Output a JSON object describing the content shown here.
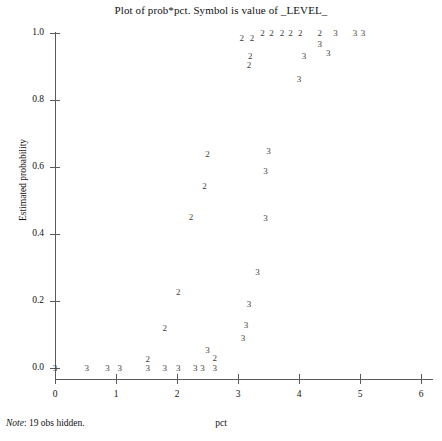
{
  "chart_data": {
    "type": "scatter",
    "title": "Plot of prob*pct. Symbol is value of _LEVEL_",
    "xlabel": "pct",
    "ylabel": "Estimated probability",
    "xlim": [
      -0.2,
      6.2
    ],
    "ylim": [
      -0.02,
      1.04
    ],
    "xticks": [
      "0",
      "1",
      "2",
      "3",
      "4",
      "5",
      "6"
    ],
    "xtick_values": [
      0,
      1,
      2,
      3,
      4,
      5,
      6
    ],
    "yticks": [
      "0.0",
      "0.2",
      "0.4",
      "0.6",
      "0.8",
      "1.0"
    ],
    "ytick_values": [
      0.0,
      0.2,
      0.4,
      0.6,
      0.8,
      1.0
    ],
    "grid": false,
    "legend": "none",
    "symbol_meaning": "plotted character is the value of _LEVEL_",
    "footnote": "19 obs hidden.",
    "footnote_prefix": "Note",
    "points": [
      {
        "x": 3.23,
        "y": 0.985,
        "label": "2"
      },
      {
        "x": 3.4,
        "y": 1.0,
        "label": "2"
      },
      {
        "x": 3.55,
        "y": 1.0,
        "label": "2"
      },
      {
        "x": 3.72,
        "y": 1.0,
        "label": "2"
      },
      {
        "x": 3.86,
        "y": 1.0,
        "label": "2"
      },
      {
        "x": 4.02,
        "y": 1.0,
        "label": "2"
      },
      {
        "x": 4.34,
        "y": 1.0,
        "label": "2"
      },
      {
        "x": 4.34,
        "y": 0.968,
        "label": "3"
      },
      {
        "x": 4.6,
        "y": 1.0,
        "label": "3"
      },
      {
        "x": 4.92,
        "y": 1.0,
        "label": "3"
      },
      {
        "x": 5.05,
        "y": 1.0,
        "label": "3"
      },
      {
        "x": 3.06,
        "y": 0.985,
        "label": "2"
      },
      {
        "x": 3.2,
        "y": 0.93,
        "label": "2"
      },
      {
        "x": 3.18,
        "y": 0.905,
        "label": "2"
      },
      {
        "x": 4.08,
        "y": 0.93,
        "label": "3"
      },
      {
        "x": 4.48,
        "y": 0.94,
        "label": "3"
      },
      {
        "x": 4.0,
        "y": 0.862,
        "label": "3"
      },
      {
        "x": 3.5,
        "y": 0.648,
        "label": "3"
      },
      {
        "x": 2.5,
        "y": 0.64,
        "label": "2"
      },
      {
        "x": 3.45,
        "y": 0.588,
        "label": "3"
      },
      {
        "x": 2.45,
        "y": 0.542,
        "label": "2"
      },
      {
        "x": 2.23,
        "y": 0.45,
        "label": "2"
      },
      {
        "x": 3.45,
        "y": 0.448,
        "label": "3"
      },
      {
        "x": 3.32,
        "y": 0.287,
        "label": "3"
      },
      {
        "x": 2.02,
        "y": 0.228,
        "label": "2"
      },
      {
        "x": 3.18,
        "y": 0.19,
        "label": "3"
      },
      {
        "x": 1.8,
        "y": 0.12,
        "label": "2"
      },
      {
        "x": 3.13,
        "y": 0.128,
        "label": "3"
      },
      {
        "x": 3.08,
        "y": 0.09,
        "label": "3"
      },
      {
        "x": 1.52,
        "y": 0.028,
        "label": "2"
      },
      {
        "x": 2.5,
        "y": 0.055,
        "label": "3"
      },
      {
        "x": 2.62,
        "y": 0.03,
        "label": "2"
      },
      {
        "x": 0.0,
        "y": 0.0,
        "label": "3"
      },
      {
        "x": 0.52,
        "y": 0.0,
        "label": "3"
      },
      {
        "x": 0.86,
        "y": 0.0,
        "label": "3"
      },
      {
        "x": 1.06,
        "y": 0.0,
        "label": "3"
      },
      {
        "x": 1.52,
        "y": 0.0,
        "label": "3"
      },
      {
        "x": 1.8,
        "y": 0.0,
        "label": "3"
      },
      {
        "x": 2.02,
        "y": 0.0,
        "label": "3"
      },
      {
        "x": 2.3,
        "y": 0.0,
        "label": "3"
      },
      {
        "x": 2.42,
        "y": 0.0,
        "label": "3"
      },
      {
        "x": 2.62,
        "y": 0.0,
        "label": "3"
      }
    ]
  }
}
